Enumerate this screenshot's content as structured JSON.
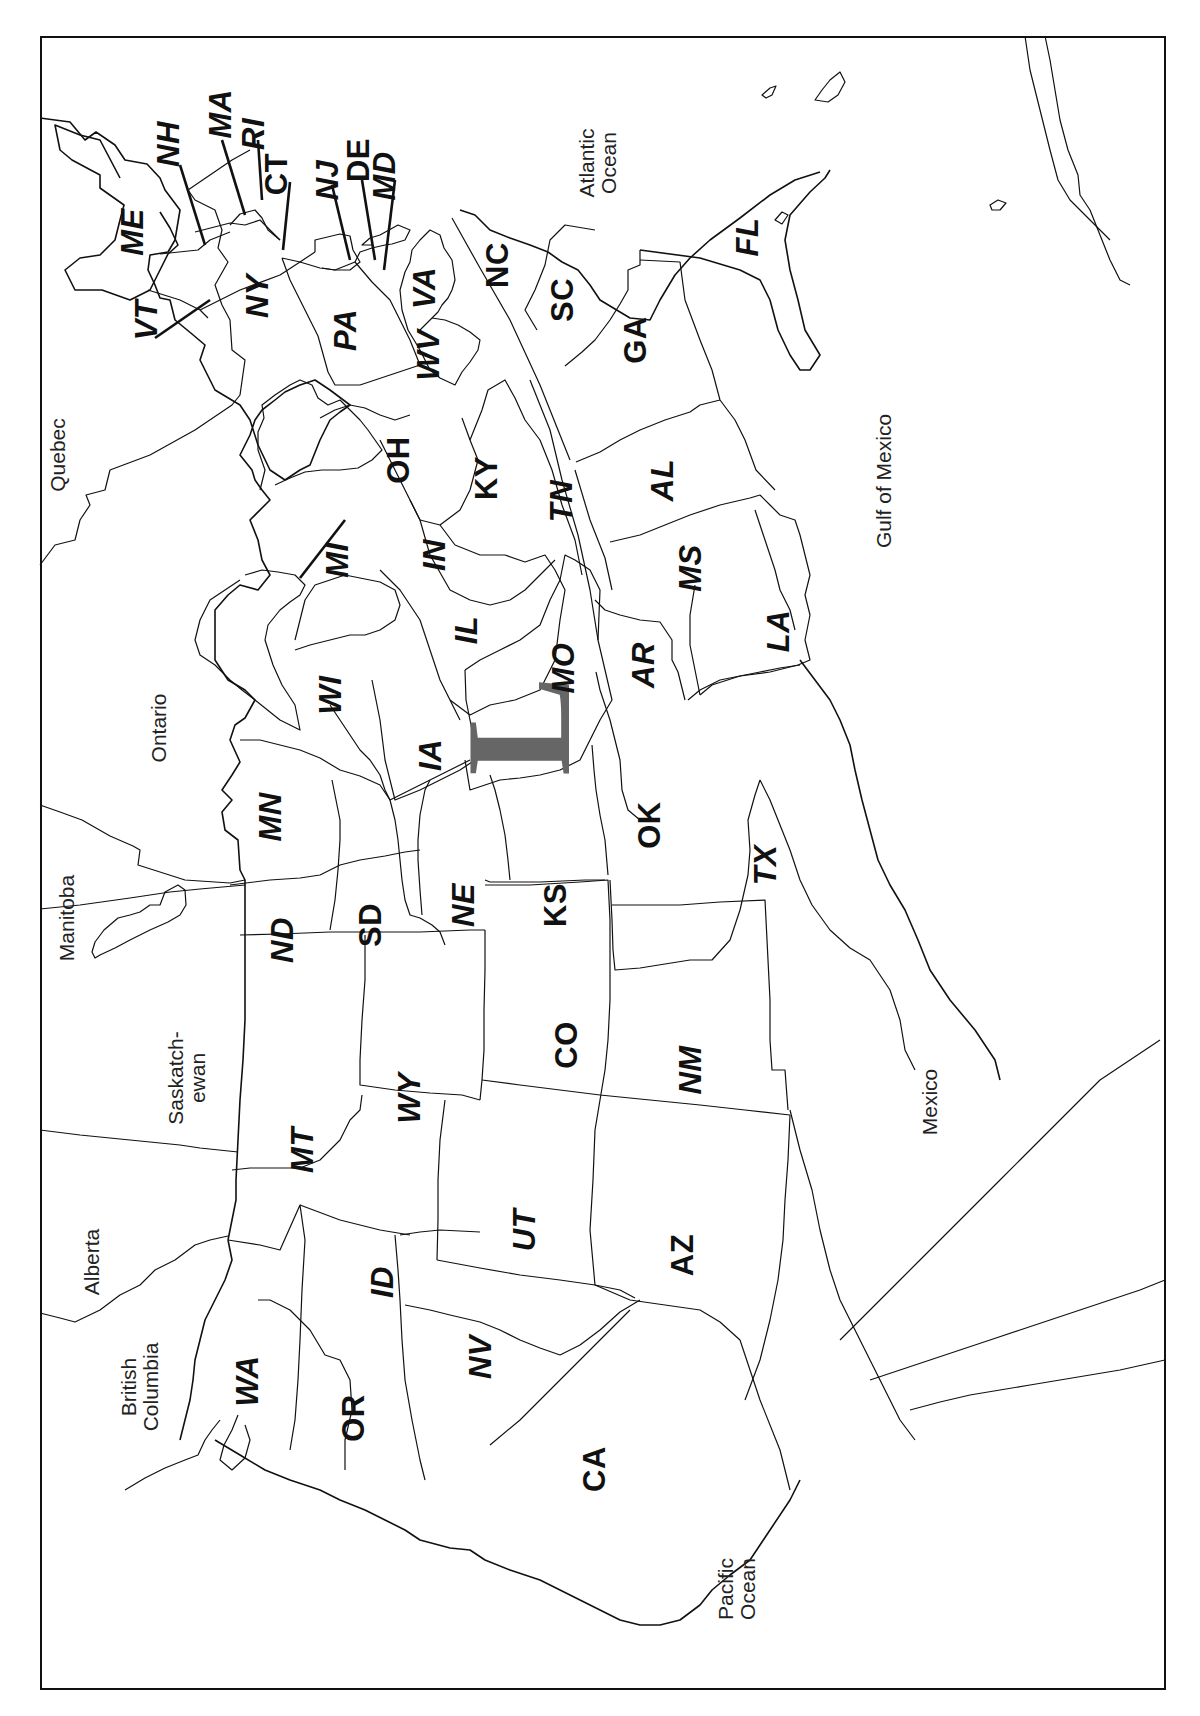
{
  "map": {
    "title": "",
    "orientation": "rotated 90 degrees counter-clockwise (north at left)",
    "overlay_glyph": {
      "text": "L",
      "color": "#666666"
    },
    "frame_color": "#111111",
    "states": [
      {
        "abbr": "ME",
        "x": 132,
        "y": 232,
        "italic": true
      },
      {
        "abbr": "NH",
        "x": 168,
        "y": 144,
        "italic": true
      },
      {
        "abbr": "MA",
        "x": 220,
        "y": 114,
        "italic": true
      },
      {
        "abbr": "RI",
        "x": 253,
        "y": 134,
        "italic": true
      },
      {
        "abbr": "CT",
        "x": 276,
        "y": 174,
        "italic": false
      },
      {
        "abbr": "NJ",
        "x": 327,
        "y": 180,
        "italic": true
      },
      {
        "abbr": "DE",
        "x": 358,
        "y": 160,
        "italic": false
      },
      {
        "abbr": "MD",
        "x": 384,
        "y": 176,
        "italic": true
      },
      {
        "abbr": "VT",
        "x": 146,
        "y": 320,
        "italic": true
      },
      {
        "abbr": "NY",
        "x": 257,
        "y": 296,
        "italic": true
      },
      {
        "abbr": "PA",
        "x": 345,
        "y": 330,
        "italic": true
      },
      {
        "abbr": "WV",
        "x": 428,
        "y": 355,
        "italic": true
      },
      {
        "abbr": "VA",
        "x": 424,
        "y": 288,
        "italic": true
      },
      {
        "abbr": "NC",
        "x": 497,
        "y": 265,
        "italic": false
      },
      {
        "abbr": "SC",
        "x": 562,
        "y": 300,
        "italic": false
      },
      {
        "abbr": "GA",
        "x": 635,
        "y": 340,
        "italic": false
      },
      {
        "abbr": "FL",
        "x": 747,
        "y": 237,
        "italic": true
      },
      {
        "abbr": "OH",
        "x": 398,
        "y": 460,
        "italic": false
      },
      {
        "abbr": "KY",
        "x": 486,
        "y": 478,
        "italic": false
      },
      {
        "abbr": "TN",
        "x": 561,
        "y": 501,
        "italic": true
      },
      {
        "abbr": "AL",
        "x": 662,
        "y": 480,
        "italic": true
      },
      {
        "abbr": "MS",
        "x": 690,
        "y": 568,
        "italic": true
      },
      {
        "abbr": "IN",
        "x": 434,
        "y": 555,
        "italic": true
      },
      {
        "abbr": "IL",
        "x": 466,
        "y": 630,
        "italic": true
      },
      {
        "abbr": "MI",
        "x": 337,
        "y": 560,
        "italic": true
      },
      {
        "abbr": "WI",
        "x": 330,
        "y": 695,
        "italic": true
      },
      {
        "abbr": "MO",
        "x": 563,
        "y": 668,
        "italic": true
      },
      {
        "abbr": "AR",
        "x": 643,
        "y": 665,
        "italic": true
      },
      {
        "abbr": "LA",
        "x": 778,
        "y": 631,
        "italic": true
      },
      {
        "abbr": "IA",
        "x": 430,
        "y": 755,
        "italic": true
      },
      {
        "abbr": "MN",
        "x": 270,
        "y": 817,
        "italic": true
      },
      {
        "abbr": "OK",
        "x": 649,
        "y": 825,
        "italic": false
      },
      {
        "abbr": "TX",
        "x": 765,
        "y": 865,
        "italic": true
      },
      {
        "abbr": "ND",
        "x": 282,
        "y": 940,
        "italic": true
      },
      {
        "abbr": "SD",
        "x": 370,
        "y": 925,
        "italic": false
      },
      {
        "abbr": "NE",
        "x": 463,
        "y": 905,
        "italic": true
      },
      {
        "abbr": "KS",
        "x": 555,
        "y": 905,
        "italic": false
      },
      {
        "abbr": "CO",
        "x": 566,
        "y": 1045,
        "italic": false
      },
      {
        "abbr": "NM",
        "x": 690,
        "y": 1070,
        "italic": true
      },
      {
        "abbr": "WY",
        "x": 409,
        "y": 1098,
        "italic": true
      },
      {
        "abbr": "MT",
        "x": 302,
        "y": 1150,
        "italic": true
      },
      {
        "abbr": "UT",
        "x": 524,
        "y": 1230,
        "italic": true
      },
      {
        "abbr": "AZ",
        "x": 682,
        "y": 1255,
        "italic": false
      },
      {
        "abbr": "ID",
        "x": 382,
        "y": 1282,
        "italic": true
      },
      {
        "abbr": "NV",
        "x": 480,
        "y": 1357,
        "italic": true
      },
      {
        "abbr": "CA",
        "x": 594,
        "y": 1469,
        "italic": false
      },
      {
        "abbr": "OR",
        "x": 353,
        "y": 1418,
        "italic": false
      },
      {
        "abbr": "WA",
        "x": 247,
        "y": 1381,
        "italic": true
      }
    ],
    "regions": [
      {
        "name": "Quebec",
        "lines": [
          "Quebec"
        ],
        "x": 57,
        "y": 455
      },
      {
        "name": "Ontario",
        "lines": [
          "Ontario"
        ],
        "x": 158,
        "y": 728
      },
      {
        "name": "Manitoba",
        "lines": [
          "Manitoba"
        ],
        "x": 66,
        "y": 918
      },
      {
        "name": "Saskatchewan",
        "lines": [
          "Saskatch-",
          "ewan"
        ],
        "x": 187,
        "y": 1078
      },
      {
        "name": "Alberta",
        "lines": [
          "Alberta"
        ],
        "x": 91,
        "y": 1262
      },
      {
        "name": "British Columbia",
        "lines": [
          "British",
          "Columbia"
        ],
        "x": 140,
        "y": 1387
      },
      {
        "name": "Atlantic Ocean",
        "lines": [
          "Atlantic",
          "Ocean"
        ],
        "x": 598,
        "y": 163
      },
      {
        "name": "Gulf of Mexico",
        "lines": [
          "Gulf of Mexico"
        ],
        "x": 883,
        "y": 481
      },
      {
        "name": "Mexico",
        "lines": [
          "Mexico"
        ],
        "x": 929,
        "y": 1102
      },
      {
        "name": "Pacific Ocean",
        "lines": [
          "Pacific",
          "Ocean"
        ],
        "x": 737,
        "y": 1589
      }
    ]
  }
}
